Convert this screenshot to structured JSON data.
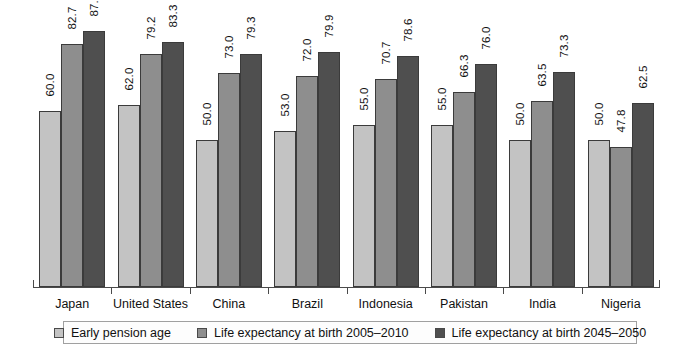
{
  "chart_data": {
    "type": "bar",
    "title": "",
    "subtitle": "",
    "xlabel": "",
    "ylabel": "",
    "ylim": [
      0,
      95
    ],
    "grid": false,
    "legend_position": "bottom",
    "categories": [
      "Japan",
      "United States",
      "China",
      "Brazil",
      "Indonesia",
      "Pakistan",
      "India",
      "Nigeria"
    ],
    "series": [
      {
        "name": "Early pension age",
        "color": "#c3c3c3",
        "values": [
          60.0,
          62.0,
          50.0,
          53.0,
          55.0,
          55.0,
          50.0,
          50.0
        ],
        "labels": [
          "60.0",
          "62.0",
          "50.0",
          "53.0",
          "55.0",
          "55.0",
          "50.0",
          "50.0"
        ]
      },
      {
        "name": "Life expectancy at birth 2005–2010",
        "color": "#8e8e8e",
        "values": [
          82.7,
          79.2,
          73.0,
          72.0,
          70.7,
          66.3,
          63.5,
          47.8
        ],
        "labels": [
          "82.7",
          "79.2",
          "73.0",
          "72.0",
          "70.7",
          "66.3",
          "63.5",
          "47.8"
        ]
      },
      {
        "name": "Life expectancy at birth 2045–2050",
        "color": "#4f4f4f",
        "values": [
          87.2,
          83.3,
          79.3,
          79.9,
          78.6,
          76.0,
          73.3,
          62.5
        ],
        "labels": [
          "87.2",
          "83.3",
          "79.3",
          "79.9",
          "78.6",
          "76.0",
          "73.3",
          "62.5"
        ]
      }
    ]
  }
}
